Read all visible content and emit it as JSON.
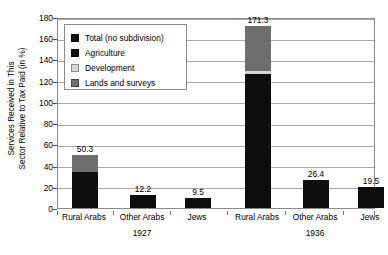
{
  "chart_data": {
    "type": "bar",
    "title": "",
    "subtitle": "",
    "xlabel": "",
    "ylabel": "Services Received in This\nSector Relative to Tax Paid (in %)",
    "ylim": [
      0,
      180
    ],
    "yticks": [
      0,
      20,
      40,
      60,
      80,
      100,
      120,
      140,
      160,
      180
    ],
    "ytick_labels": [
      "0",
      "20",
      "40",
      "60",
      "80",
      "100",
      "120",
      "140",
      "160",
      "180"
    ],
    "grid": true,
    "grid_axis": "y",
    "stacked": true,
    "legend_position": "upper-left-inside",
    "groups": [
      {
        "label": "1927"
      },
      {
        "label": "1936"
      }
    ],
    "categories": [
      "Rural Arabs",
      "Other Arabs",
      "Jews",
      "Rural Arabs",
      "Other Arabs",
      "Jews"
    ],
    "legend": [
      {
        "key": "total",
        "name": "Total (no subdivision)",
        "color": "#0d0d0d"
      },
      {
        "key": "agri",
        "name": "Agriculture",
        "color": "#0d0d0d"
      },
      {
        "key": "dev",
        "name": "Development",
        "color": "#d6d6d6"
      },
      {
        "key": "lands",
        "name": "Lands and surveys",
        "color": "#6e6e6e"
      }
    ],
    "series": [
      {
        "name": "Agriculture",
        "key": "agri",
        "values": [
          34.2,
          0,
          0,
          126.0,
          0,
          0
        ]
      },
      {
        "name": "Development",
        "key": "dev",
        "values": [
          0,
          0,
          0,
          3.5,
          0,
          0
        ]
      },
      {
        "name": "Lands and surveys",
        "key": "lands",
        "values": [
          16.1,
          0,
          0,
          41.8,
          0,
          0
        ]
      },
      {
        "name": "Total (no subdivision)",
        "key": "total",
        "values": [
          0,
          12.2,
          9.5,
          0,
          26.4,
          19.5
        ]
      }
    ],
    "bars": [
      {
        "category": "Rural Arabs",
        "group": "1927",
        "total": 50.3,
        "value_label": "50.3",
        "segments": [
          {
            "key": "agri",
            "name": "Agriculture",
            "value": 34.2
          },
          {
            "key": "lands",
            "name": "Lands and surveys",
            "value": 16.1
          }
        ]
      },
      {
        "category": "Other Arabs",
        "group": "1927",
        "total": 12.2,
        "value_label": "12.2",
        "segments": [
          {
            "key": "total",
            "name": "Total (no subdivision)",
            "value": 12.2
          }
        ]
      },
      {
        "category": "Jews",
        "group": "1927",
        "total": 9.5,
        "value_label": "9.5",
        "segments": [
          {
            "key": "total",
            "name": "Total (no subdivision)",
            "value": 9.5
          }
        ]
      },
      {
        "category": "Rural Arabs",
        "group": "1936",
        "total": 171.3,
        "value_label": "171.3",
        "segments": [
          {
            "key": "agri",
            "name": "Agriculture",
            "value": 126.0
          },
          {
            "key": "dev",
            "name": "Development",
            "value": 3.5
          },
          {
            "key": "lands",
            "name": "Lands and surveys",
            "value": 41.8
          }
        ]
      },
      {
        "category": "Other Arabs",
        "group": "1936",
        "total": 26.4,
        "value_label": "26.4",
        "segments": [
          {
            "key": "total",
            "name": "Total (no subdivision)",
            "value": 26.4
          }
        ]
      },
      {
        "category": "Jews",
        "group": "1936",
        "total": 19.5,
        "value_label": "19.5",
        "segments": [
          {
            "key": "total",
            "name": "Total (no subdivision)",
            "value": 19.5
          }
        ]
      }
    ],
    "colors": {
      "total": "#0d0d0d",
      "agriculture": "#0d0d0d",
      "development": "#d6d6d6",
      "lands_and_surveys": "#6e6e6e",
      "axis": "#8a8a8a",
      "grid": "#a9a9a9",
      "background": "#ffffff",
      "text": "#000000"
    }
  }
}
